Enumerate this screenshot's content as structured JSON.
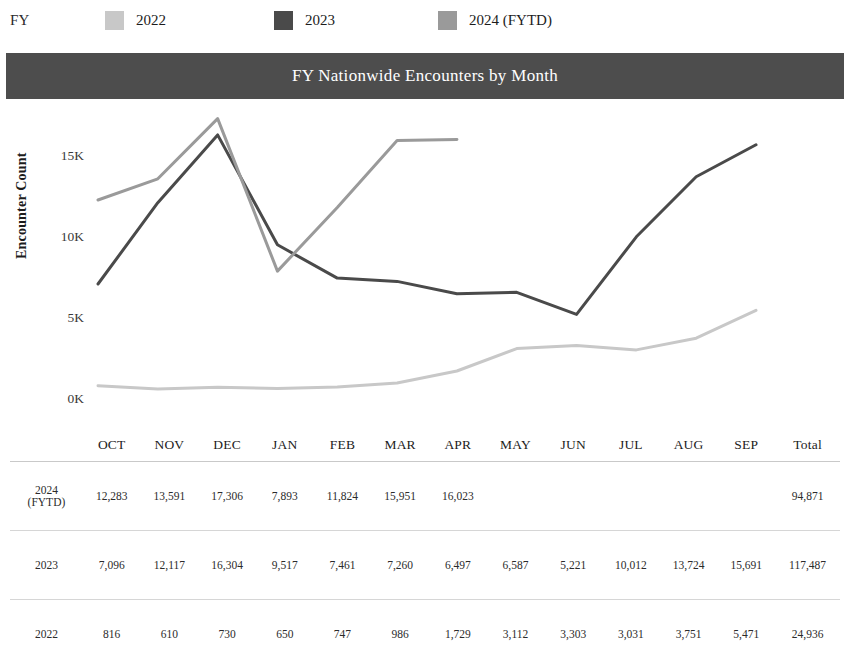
{
  "legend": {
    "title": "FY",
    "items": [
      {
        "label": "2022",
        "color": "#c8c8c8",
        "swatch_name": "legend-swatch-2022"
      },
      {
        "label": "2023",
        "color": "#4a4a4a",
        "swatch_name": "legend-swatch-2023"
      },
      {
        "label": "2024 (FYTD)",
        "color": "#9a9a9a",
        "swatch_name": "legend-swatch-2024"
      }
    ]
  },
  "header": {
    "title": "FY Nationwide Encounters by Month",
    "bar_color": "#4d4d4d",
    "text_color": "#ffffff"
  },
  "chart_data": {
    "type": "line",
    "title": "FY Nationwide Encounters by Month",
    "xlabel": "",
    "ylabel": "Encounter Count",
    "ylim": [
      0,
      17500
    ],
    "yticks": [
      0,
      5000,
      10000,
      15000
    ],
    "ytick_labels": [
      "0K",
      "5K",
      "10K",
      "15K"
    ],
    "grid": false,
    "legend_position": "top",
    "categories": [
      "OCT",
      "NOV",
      "DEC",
      "JAN",
      "FEB",
      "MAR",
      "APR",
      "MAY",
      "JUN",
      "JUL",
      "AUG",
      "SEP"
    ],
    "series": [
      {
        "name": "2022",
        "color": "#c8c8c8",
        "values": [
          816,
          610,
          730,
          650,
          747,
          986,
          1729,
          3112,
          3303,
          3031,
          3751,
          5471
        ],
        "total": 24936
      },
      {
        "name": "2023",
        "color": "#4a4a4a",
        "values": [
          7096,
          12117,
          16304,
          9517,
          7461,
          7260,
          6497,
          6587,
          5221,
          10012,
          13724,
          15691
        ],
        "total": 117487
      },
      {
        "name": "2024 (FYTD)",
        "color": "#9a9a9a",
        "values": [
          12283,
          13591,
          17306,
          7893,
          11824,
          15951,
          16023,
          null,
          null,
          null,
          null,
          null
        ],
        "total": 94871
      }
    ]
  },
  "table": {
    "columns": [
      "",
      "OCT",
      "NOV",
      "DEC",
      "JAN",
      "FEB",
      "MAR",
      "APR",
      "MAY",
      "JUN",
      "JUL",
      "AUG",
      "SEP",
      "Total"
    ],
    "rows": [
      {
        "label": "2024",
        "label_sub": "(FYTD)",
        "cells": [
          "12,283",
          "13,591",
          "17,306",
          "7,893",
          "11,824",
          "15,951",
          "16,023",
          "",
          "",
          "",
          "",
          "",
          "94,871"
        ]
      },
      {
        "label": "2023",
        "label_sub": "",
        "cells": [
          "7,096",
          "12,117",
          "16,304",
          "9,517",
          "7,461",
          "7,260",
          "6,497",
          "6,587",
          "5,221",
          "10,012",
          "13,724",
          "15,691",
          "117,487"
        ]
      },
      {
        "label": "2022",
        "label_sub": "",
        "cells": [
          "816",
          "610",
          "730",
          "650",
          "747",
          "986",
          "1,729",
          "3,112",
          "3,303",
          "3,031",
          "3,751",
          "5,471",
          "24,936"
        ]
      }
    ]
  }
}
